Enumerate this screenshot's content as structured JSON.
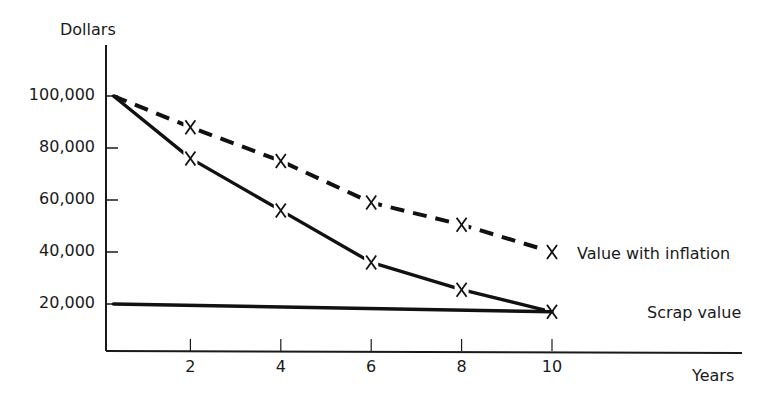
{
  "chart_data": {
    "type": "line",
    "title": "",
    "xlabel": "Years",
    "ylabel": "Dollars",
    "xlim": [
      0,
      10
    ],
    "ylim": [
      0,
      110000
    ],
    "grid": false,
    "legend_position": "inline-right",
    "x_ticks": [
      2,
      4,
      6,
      8,
      10
    ],
    "x_tick_labels": [
      "2",
      "4",
      "6",
      "8",
      "10"
    ],
    "y_ticks": [
      20000,
      40000,
      60000,
      80000,
      100000
    ],
    "y_tick_labels": [
      "20,000",
      "40,000",
      "60,000",
      "80,000",
      "100,000"
    ],
    "series": [
      {
        "name": "Value with inflation",
        "style": "dashed",
        "marker": "x",
        "x": [
          0.3,
          2,
          4,
          6,
          8,
          10
        ],
        "values": [
          100000,
          88000,
          75000,
          59000,
          50500,
          40000
        ]
      },
      {
        "name": "Depreciated value",
        "style": "solid",
        "marker": "x",
        "x": [
          0.3,
          2,
          4,
          6,
          8,
          10
        ],
        "values": [
          100000,
          76000,
          56000,
          36000,
          25500,
          17000
        ]
      },
      {
        "name": "Scrap value",
        "style": "solid-thick",
        "marker": "none",
        "x": [
          0.3,
          10
        ],
        "values": [
          20000,
          17000
        ]
      }
    ],
    "annotations": [
      {
        "text": "Value with inflation",
        "series": 0
      },
      {
        "text": "Scrap value",
        "series": 2
      }
    ]
  },
  "labels": {
    "y_axis": "Dollars",
    "x_axis": "Years",
    "inflation": "Value with inflation",
    "scrap": "Scrap value"
  }
}
